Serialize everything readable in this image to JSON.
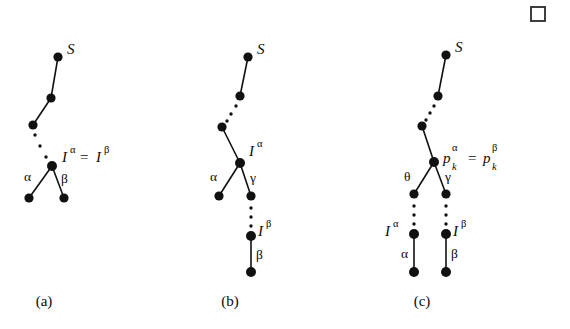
{
  "figure": {
    "background_color": "#ffffff",
    "ink_color": "#111111",
    "qed_symbol": {
      "name": "end-of-proof-square",
      "x": 531,
      "y": 7,
      "size": 14
    },
    "captions": [
      {
        "label": "(a)",
        "x": 44,
        "y": 305
      },
      {
        "label": "(b)",
        "x": 230,
        "y": 305
      },
      {
        "label": "(c)",
        "x": 422,
        "y": 305
      }
    ],
    "panels": [
      {
        "id": "panel-a",
        "caption": "(a)",
        "nodes": [
          {
            "name": "root-s",
            "x": 58,
            "y": 57,
            "r": 4.6
          },
          {
            "name": "chain-1",
            "x": 51,
            "y": 98,
            "r": 4.6
          },
          {
            "name": "chain-2",
            "x": 33,
            "y": 125,
            "r": 4.6
          },
          {
            "name": "branch-point",
            "x": 52,
            "y": 166,
            "r": 5.0
          },
          {
            "name": "leaf-alpha",
            "x": 29,
            "y": 198,
            "r": 4.6
          },
          {
            "name": "leaf-beta",
            "x": 64,
            "y": 198,
            "r": 4.6
          }
        ],
        "edges": [
          {
            "name": "edge-s-chain1",
            "x1": 58,
            "y1": 57,
            "x2": 51,
            "y2": 98
          },
          {
            "name": "edge-chain1-chain2",
            "x1": 51,
            "y1": 98,
            "x2": 33,
            "y2": 125
          },
          {
            "name": "edge-branch-leaf-alpha",
            "x1": 52,
            "y1": 166,
            "x2": 29,
            "y2": 198
          },
          {
            "name": "edge-branch-leaf-beta",
            "x1": 52,
            "y1": 166,
            "x2": 64,
            "y2": 198
          }
        ],
        "dotted_paths": [
          {
            "name": "dots-chain2-to-branch",
            "dots": [
              {
                "x": 35,
                "y": 135,
                "r": 1.7
              },
              {
                "x": 40,
                "y": 146,
                "r": 1.7
              },
              {
                "x": 46,
                "y": 157,
                "r": 1.7
              }
            ]
          }
        ],
        "labels": [
          {
            "name": "label-s",
            "text": "S",
            "x": 67,
            "y": 54,
            "style": "italic-serif"
          },
          {
            "name": "label-alpha-edge",
            "text": "α",
            "x": 24,
            "y": 180,
            "style": "greek"
          },
          {
            "name": "label-beta-edge",
            "text": "β",
            "x": 62,
            "y": 182,
            "style": "greek"
          }
        ],
        "equation": {
          "name": "equation-i-alpha-equals-i-beta",
          "x": 62,
          "y": 160,
          "parts": [
            {
              "base": "I",
              "sup": "α"
            },
            {
              "op": "="
            },
            {
              "base": "I",
              "sup": "β"
            }
          ],
          "text": "I^α = I^β"
        }
      },
      {
        "id": "panel-b",
        "caption": "(b)",
        "nodes": [
          {
            "name": "root-s",
            "x": 248,
            "y": 57,
            "r": 4.6
          },
          {
            "name": "chain-1",
            "x": 240,
            "y": 96,
            "r": 4.6
          },
          {
            "name": "chain-2",
            "x": 222,
            "y": 127,
            "r": 4.6
          },
          {
            "name": "branch-point",
            "x": 240,
            "y": 163,
            "r": 5.0
          },
          {
            "name": "leaf-alpha",
            "x": 219,
            "y": 196,
            "r": 4.6
          },
          {
            "name": "node-gamma",
            "x": 251,
            "y": 196,
            "r": 4.6
          },
          {
            "name": "node-i-beta",
            "x": 251,
            "y": 236,
            "r": 5.0
          },
          {
            "name": "leaf-beta",
            "x": 251,
            "y": 272,
            "r": 5.0
          }
        ],
        "edges": [
          {
            "name": "edge-s-chain1",
            "x1": 248,
            "y1": 57,
            "x2": 240,
            "y2": 96
          },
          {
            "name": "edge-chain2-branch",
            "x1": 222,
            "y1": 127,
            "x2": 240,
            "y2": 163
          },
          {
            "name": "edge-branch-leaf-alpha",
            "x1": 240,
            "y1": 163,
            "x2": 219,
            "y2": 196
          },
          {
            "name": "edge-branch-gamma",
            "x1": 240,
            "y1": 163,
            "x2": 251,
            "y2": 196
          },
          {
            "name": "edge-ibeta-leaf-beta",
            "x1": 251,
            "y1": 236,
            "x2": 251,
            "y2": 272
          }
        ],
        "dotted_paths": [
          {
            "name": "dots-chain1-to-chain2",
            "dots": [
              {
                "x": 236,
                "y": 106,
                "r": 1.7
              },
              {
                "x": 231,
                "y": 114,
                "r": 1.7
              },
              {
                "x": 227,
                "y": 121,
                "r": 1.7
              }
            ]
          },
          {
            "name": "dots-gamma-to-ibeta",
            "dots": [
              {
                "x": 251,
                "y": 208,
                "r": 1.7
              },
              {
                "x": 251,
                "y": 217,
                "r": 1.7
              },
              {
                "x": 251,
                "y": 226,
                "r": 1.7
              }
            ]
          }
        ],
        "labels": [
          {
            "name": "label-s",
            "text": "S",
            "x": 257,
            "y": 54,
            "style": "italic-serif"
          },
          {
            "name": "label-alpha-edge",
            "text": "α",
            "x": 212,
            "y": 180,
            "style": "greek"
          },
          {
            "name": "label-gamma-edge",
            "text": "γ",
            "x": 253,
            "y": 182,
            "style": "greek"
          },
          {
            "name": "label-beta-edge",
            "text": "β",
            "x": 258,
            "y": 258,
            "style": "greek"
          }
        ],
        "sup_labels": [
          {
            "name": "label-i-alpha",
            "base": "I",
            "sup": "α",
            "x": 251,
            "y": 155,
            "text": "I^α"
          },
          {
            "name": "label-i-beta",
            "base": "I",
            "sup": "β",
            "x": 259,
            "y": 234,
            "text": "I^β"
          }
        ]
      },
      {
        "id": "panel-c",
        "caption": "(c)",
        "nodes": [
          {
            "name": "root-s",
            "x": 446,
            "y": 55,
            "r": 4.6
          },
          {
            "name": "chain-1",
            "x": 438,
            "y": 96,
            "r": 4.6
          },
          {
            "name": "chain-2",
            "x": 422,
            "y": 126,
            "r": 4.6
          },
          {
            "name": "branch-point",
            "x": 434,
            "y": 162,
            "r": 5.0
          },
          {
            "name": "node-theta",
            "x": 414,
            "y": 194,
            "r": 4.6
          },
          {
            "name": "node-gamma",
            "x": 446,
            "y": 194,
            "r": 4.6
          },
          {
            "name": "node-i-alpha",
            "x": 414,
            "y": 234,
            "r": 5.0
          },
          {
            "name": "node-i-beta",
            "x": 446,
            "y": 234,
            "r": 5.0
          },
          {
            "name": "leaf-alpha",
            "x": 414,
            "y": 272,
            "r": 5.0
          },
          {
            "name": "leaf-beta",
            "x": 446,
            "y": 272,
            "r": 5.0
          }
        ],
        "edges": [
          {
            "name": "edge-s-chain1",
            "x1": 446,
            "y1": 55,
            "x2": 438,
            "y2": 96
          },
          {
            "name": "edge-chain2-branch",
            "x1": 422,
            "y1": 126,
            "x2": 434,
            "y2": 162
          },
          {
            "name": "edge-branch-theta",
            "x1": 434,
            "y1": 162,
            "x2": 414,
            "y2": 194
          },
          {
            "name": "edge-branch-gamma",
            "x1": 434,
            "y1": 162,
            "x2": 446,
            "y2": 194
          },
          {
            "name": "edge-ialpha-leaf-alpha",
            "x1": 414,
            "y1": 234,
            "x2": 414,
            "y2": 272
          },
          {
            "name": "edge-ibeta-leaf-beta",
            "x1": 446,
            "y1": 234,
            "x2": 446,
            "y2": 272
          }
        ],
        "dotted_paths": [
          {
            "name": "dots-chain1-to-chain2",
            "dots": [
              {
                "x": 434,
                "y": 106,
                "r": 1.7
              },
              {
                "x": 430,
                "y": 113,
                "r": 1.7
              },
              {
                "x": 426,
                "y": 120,
                "r": 1.7
              }
            ]
          },
          {
            "name": "dots-theta-to-ialpha",
            "dots": [
              {
                "x": 414,
                "y": 206,
                "r": 1.7
              },
              {
                "x": 414,
                "y": 215,
                "r": 1.7
              },
              {
                "x": 414,
                "y": 224,
                "r": 1.7
              }
            ]
          },
          {
            "name": "dots-gamma-to-ibeta",
            "dots": [
              {
                "x": 446,
                "y": 206,
                "r": 1.7
              },
              {
                "x": 446,
                "y": 215,
                "r": 1.7
              },
              {
                "x": 446,
                "y": 224,
                "r": 1.7
              }
            ]
          }
        ],
        "labels": [
          {
            "name": "label-s",
            "text": "S",
            "x": 455,
            "y": 52,
            "style": "italic-serif"
          },
          {
            "name": "label-theta-edge",
            "text": "θ",
            "x": 408,
            "y": 180,
            "style": "greek"
          },
          {
            "name": "label-gamma-edge",
            "text": "γ",
            "x": 448,
            "y": 180,
            "style": "greek"
          },
          {
            "name": "label-alpha-edge",
            "text": "α",
            "x": 404,
            "y": 256,
            "style": "greek"
          },
          {
            "name": "label-beta-edge",
            "text": "β",
            "x": 452,
            "y": 256,
            "style": "greek"
          }
        ],
        "sup_labels": [
          {
            "name": "label-i-alpha",
            "base": "I",
            "sup": "α",
            "x": 386,
            "y": 232,
            "text": "I^α"
          },
          {
            "name": "label-i-beta",
            "base": "I",
            "sup": "β",
            "x": 454,
            "y": 232,
            "text": "I^β"
          }
        ],
        "equation": {
          "name": "equation-pk-alpha-equals-pk-beta",
          "x": 443,
          "y": 163,
          "text": "p_k^α = p_k^β",
          "parts": [
            {
              "base": "p",
              "sup": "α",
              "sub": "k"
            },
            {
              "op": "="
            },
            {
              "base": "p",
              "sup": "β",
              "sub": "k"
            }
          ]
        }
      }
    ]
  }
}
